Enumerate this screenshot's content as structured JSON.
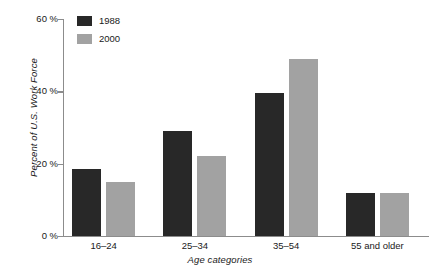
{
  "chart_data": {
    "type": "bar",
    "title": "",
    "subtitle": "",
    "xlabel": "Age categories",
    "ylabel": "Percent of U.S. Work Force",
    "categories": [
      "16–24",
      "25–34",
      "35–54",
      "55 and older"
    ],
    "series": [
      {
        "name": "1988",
        "color": "#282828",
        "values": [
          18.5,
          29,
          39.5,
          12
        ]
      },
      {
        "name": "2000",
        "color": "#a2a2a2",
        "values": [
          15,
          22,
          49,
          12
        ]
      }
    ],
    "ylim": [
      0,
      60
    ],
    "yticks": [
      0,
      20,
      40,
      60
    ],
    "ytick_labels": [
      "0 %",
      "20 %",
      "40 %",
      "60 %"
    ],
    "grid": false,
    "legend_position": "top-left",
    "axis_color": "#8c8c8c"
  },
  "legend": {
    "items": [
      {
        "label": "1988",
        "swatch_name": "legend-swatch-1988"
      },
      {
        "label": "2000",
        "swatch_name": "legend-swatch-2000"
      }
    ]
  }
}
